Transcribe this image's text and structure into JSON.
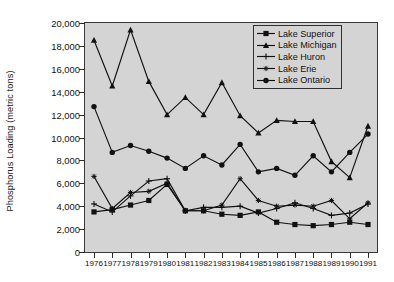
{
  "chart_data": {
    "type": "line",
    "title": "",
    "xlabel": "",
    "ylabel": "Phosphorus Loading (metric tons)",
    "x": [
      1976,
      1977,
      1978,
      1979,
      1980,
      1981,
      1982,
      1983,
      1984,
      1985,
      1986,
      1987,
      1988,
      1989,
      1990,
      1991
    ],
    "xticklabels": [
      "1976",
      "1977",
      "1978",
      "1979",
      "1980",
      "1981",
      "1982",
      "1983",
      "1984",
      "1985",
      "1986",
      "1987",
      "1988",
      "1989",
      "1990",
      "1991"
    ],
    "ylim": [
      0,
      20000
    ],
    "yticks": [
      0,
      2000,
      4000,
      6000,
      8000,
      10000,
      12000,
      14000,
      16000,
      18000,
      20000
    ],
    "yticklabels": [
      "0",
      "2,000",
      "4,000",
      "6,000",
      "8,000",
      "10,000",
      "12,000",
      "14,000",
      "16,000",
      "18,000",
      "20,000"
    ],
    "grid": false,
    "legend_position": "top-right",
    "plot_background": "#d4d4d4",
    "series": [
      {
        "name": "Lake Superior",
        "marker": "filled-square",
        "color": "#111111",
        "values": [
          3500,
          3700,
          4100,
          4500,
          5900,
          3600,
          3600,
          3300,
          3200,
          3500,
          2600,
          2400,
          2300,
          2400,
          2600,
          2400
        ]
      },
      {
        "name": "Lake Michigan",
        "marker": "filled-triangle",
        "color": "#111111",
        "values": [
          18500,
          14500,
          19400,
          14900,
          12000,
          13500,
          12000,
          14800,
          11900,
          10400,
          11500,
          11400,
          11400,
          7900,
          6500,
          11000
        ]
      },
      {
        "name": "Lake Huron",
        "marker": "plus",
        "color": "#111111",
        "values": [
          4200,
          3500,
          4900,
          6200,
          6400,
          3600,
          3900,
          3900,
          4000,
          3400,
          3800,
          4300,
          3800,
          3200,
          3400,
          4200
        ]
      },
      {
        "name": "Lake Erie",
        "marker": "asterisk",
        "color": "#111111",
        "values": [
          6600,
          3800,
          5200,
          5300,
          6000,
          3600,
          3600,
          4100,
          6400,
          4500,
          4000,
          4100,
          4000,
          4500,
          2900,
          4300
        ]
      },
      {
        "name": "Lake Ontario",
        "marker": "filled-circle",
        "color": "#111111",
        "values": [
          12700,
          8700,
          9300,
          8800,
          8200,
          7300,
          8400,
          7600,
          9400,
          7000,
          7300,
          6700,
          8400,
          7000,
          8700,
          10300
        ]
      }
    ]
  },
  "legend": {
    "items": [
      {
        "label": "Lake Superior"
      },
      {
        "label": "Lake Michigan"
      },
      {
        "label": "Lake Huron"
      },
      {
        "label": "Lake Erie"
      },
      {
        "label": "Lake Ontario"
      }
    ]
  }
}
